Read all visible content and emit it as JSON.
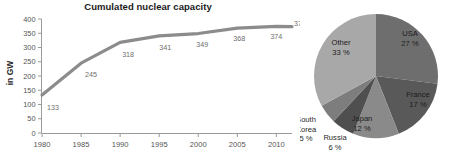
{
  "chart_data": [
    {
      "type": "line",
      "title": "Cumulated nuclear capacity",
      "xlabel": "",
      "ylabel": "in GW",
      "x": [
        1980,
        1985,
        1990,
        1995,
        2000,
        2005,
        2010,
        2012
      ],
      "values": [
        133,
        245,
        318,
        341,
        349,
        368,
        374,
        373
      ],
      "point_labels": [
        "133",
        "245",
        "318",
        "341",
        "349",
        "368",
        "374",
        "373"
      ],
      "xticks": [
        "1980",
        "1985",
        "1990",
        "1995",
        "2000",
        "2005",
        "2010"
      ],
      "xtick_values": [
        1980,
        1985,
        1990,
        1995,
        2000,
        2005,
        2010
      ],
      "yticks": [
        "0",
        "50",
        "100",
        "150",
        "200",
        "250",
        "300",
        "350",
        "400"
      ],
      "ytick_values": [
        0,
        50,
        100,
        150,
        200,
        250,
        300,
        350,
        400
      ],
      "ylim": [
        0,
        400
      ],
      "xlim": [
        1980,
        2012
      ],
      "grid": false,
      "legend": "none",
      "line_color": "#8c8c8c"
    },
    {
      "type": "pie",
      "title": "",
      "categories": [
        "USA",
        "France",
        "Japan",
        "Russia",
        "South Korea",
        "Other"
      ],
      "values": [
        27,
        17,
        12,
        6,
        5,
        33
      ],
      "value_labels": [
        "27 %",
        "17 %",
        "12 %",
        "6 %",
        "5 %",
        "33 %"
      ],
      "colors": [
        "#6e6e6e",
        "#595959",
        "#8a8a8a",
        "#4f4f4f",
        "#7d7d7d",
        "#a8a8a8"
      ],
      "start_angle_deg": 0,
      "direction": "clockwise",
      "legend": "labels-on-slices"
    }
  ]
}
